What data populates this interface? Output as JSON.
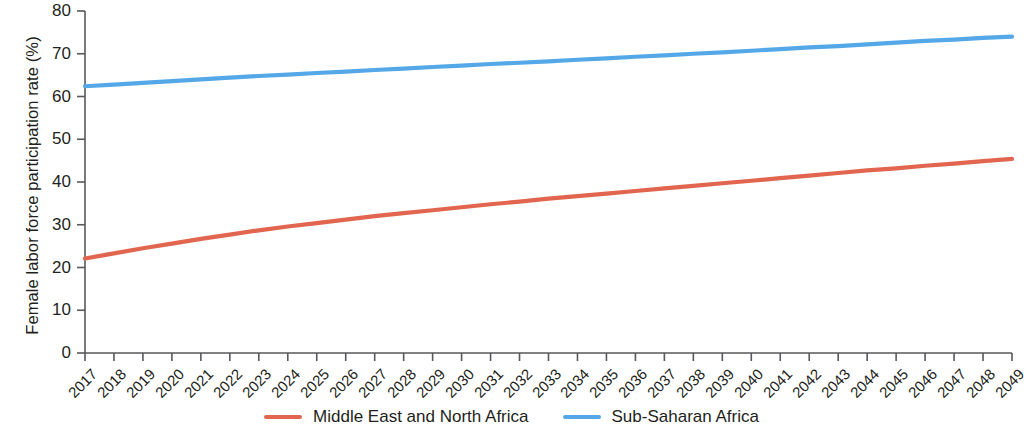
{
  "chart_data": {
    "type": "line",
    "title": "",
    "xlabel": "",
    "ylabel": "Female labor force participation rate (%)",
    "xlim": [
      2017,
      2049
    ],
    "ylim": [
      0,
      80
    ],
    "yticks": [
      0,
      10,
      20,
      30,
      40,
      50,
      60,
      70,
      80
    ],
    "grid": false,
    "legend_position": "bottom-center",
    "x": [
      2017,
      2018,
      2019,
      2020,
      2021,
      2022,
      2023,
      2024,
      2025,
      2026,
      2027,
      2028,
      2029,
      2030,
      2031,
      2032,
      2033,
      2034,
      2035,
      2036,
      2037,
      2038,
      2039,
      2040,
      2041,
      2042,
      2043,
      2044,
      2045,
      2046,
      2047,
      2048,
      2049
    ],
    "categories": [
      "2017",
      "2018",
      "2019",
      "2020",
      "2021",
      "2022",
      "2023",
      "2024",
      "2025",
      "2026",
      "2027",
      "2028",
      "2029",
      "2030",
      "2031",
      "2032",
      "2033",
      "2034",
      "2035",
      "2036",
      "2037",
      "2038",
      "2039",
      "2040",
      "2041",
      "2042",
      "2043",
      "2044",
      "2045",
      "2046",
      "2047",
      "2048",
      "2049"
    ],
    "series": [
      {
        "name": "Middle East and North Africa",
        "color": "#e2664f",
        "values": [
          22.1,
          23.3,
          24.5,
          25.6,
          26.7,
          27.7,
          28.7,
          29.6,
          30.4,
          31.2,
          32.0,
          32.7,
          33.4,
          34.1,
          34.8,
          35.4,
          36.1,
          36.7,
          37.3,
          37.9,
          38.5,
          39.1,
          39.7,
          40.3,
          40.9,
          41.5,
          42.1,
          42.7,
          43.2,
          43.8,
          44.3,
          44.9,
          45.4
        ]
      },
      {
        "name": "Sub-Saharan Africa",
        "color": "#54a8e8",
        "values": [
          62.4,
          62.8,
          63.2,
          63.6,
          64.0,
          64.4,
          64.8,
          65.1,
          65.5,
          65.8,
          66.2,
          66.5,
          66.9,
          67.2,
          67.6,
          67.9,
          68.2,
          68.6,
          68.9,
          69.3,
          69.6,
          70.0,
          70.3,
          70.7,
          71.1,
          71.5,
          71.8,
          72.2,
          72.6,
          73.0,
          73.3,
          73.7,
          74.0
        ]
      }
    ]
  },
  "legend": {
    "items": [
      {
        "label": "Middle East and North Africa",
        "color": "#e2664f"
      },
      {
        "label": "Sub-Saharan Africa",
        "color": "#54a8e8"
      }
    ]
  },
  "axes": {
    "y_title": "Female labor force participation rate (%)",
    "y_labels": [
      "80",
      "70",
      "60",
      "50",
      "40",
      "30",
      "20",
      "10",
      "0"
    ],
    "axis_color": "#58595b"
  }
}
